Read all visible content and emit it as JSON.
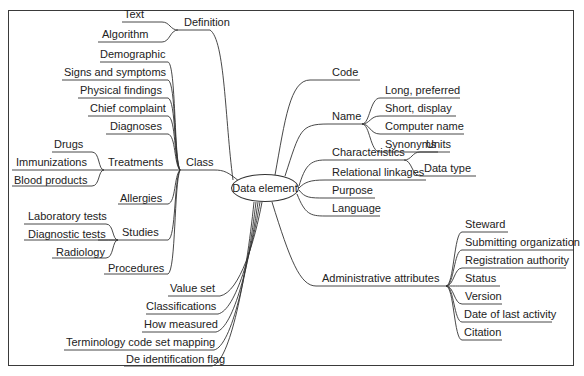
{
  "center": {
    "label": "Data element"
  },
  "left": {
    "definition": {
      "label": "Definition",
      "children": [
        "Text",
        "Algorithm"
      ]
    },
    "class": {
      "label": "Class",
      "children": {
        "demographic": "Demographic",
        "signs": "Signs and symptoms",
        "physical": "Physical findings",
        "chief": "Chief complaint",
        "diagnoses": "Diagnoses",
        "treatments": {
          "label": "Treatments",
          "children": [
            "Drugs",
            "Immunizations",
            "Blood products"
          ]
        },
        "allergies": "Allergies",
        "studies": {
          "label": "Studies",
          "children": [
            "Laboratory tests",
            "Diagnostic tests",
            "Radiology"
          ]
        },
        "procedures": "Procedures"
      }
    },
    "value_set": "Value set",
    "classifications": "Classifications",
    "how_measured": "How measured",
    "terminology": "Terminology code set mapping",
    "deid": "De identification flag"
  },
  "right": {
    "code": "Code",
    "name": {
      "label": "Name",
      "children": [
        "Long, preferred",
        "Short, display",
        "Computer name",
        "Synonyms"
      ]
    },
    "characteristics": {
      "label": "Characteristics",
      "children": [
        "Units",
        "Data type"
      ]
    },
    "relational": "Relational linkages",
    "purpose": "Purpose",
    "language": "Language",
    "admin": {
      "label": "Administrative attributes",
      "children": [
        "Steward",
        "Submitting organization",
        "Registration authority",
        "Status",
        "Version",
        "Date of last activity",
        "Citation"
      ]
    }
  },
  "colors": {
    "line": "#333333",
    "text": "#222222",
    "background": "#ffffff"
  }
}
